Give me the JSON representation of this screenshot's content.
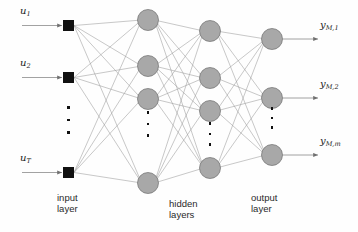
{
  "diagram": {
    "background_color": "#fefefe",
    "node_fill": "#a8a8a8",
    "node_stroke": "#6e6e6e",
    "input_node_fill": "#111111",
    "edge_color": "#9a9a9a",
    "arrow_color": "#6f6f6f"
  },
  "inputs": {
    "labels": [
      "u",
      "u",
      "u"
    ],
    "subscripts": [
      "1",
      "2",
      "T"
    ],
    "nodes": [
      {
        "x": 68.5,
        "y": 25.5
      },
      {
        "x": 68.5,
        "y": 77.5
      },
      {
        "x": 68.5,
        "y": 172.5
      }
    ],
    "arrow_start_x": 22,
    "label_positions": [
      {
        "x": 20,
        "y": 5
      },
      {
        "x": 20,
        "y": 57
      },
      {
        "x": 20,
        "y": 152
      }
    ],
    "ellipsis": {
      "x": 68.5,
      "y": 120,
      "count": 3,
      "height": 28
    }
  },
  "hidden": {
    "columns": [
      {
        "cx": 148,
        "nodes_y": [
          20,
          66,
          99,
          183
        ],
        "ellipsis": {
          "y": 124,
          "height": 26
        }
      },
      {
        "cx": 210,
        "nodes_y": [
          31,
          78,
          111,
          168
        ],
        "ellipsis": {
          "y": 134,
          "height": 24
        }
      }
    ],
    "radius": 10.5
  },
  "output": {
    "cx": 272,
    "nodes_y": [
      39,
      98,
      155
    ],
    "radius": 10.5,
    "labels": [
      "y",
      "y",
      "y"
    ],
    "subscripts": [
      "M,1",
      "M,2",
      "M,m"
    ],
    "arrow_end_x": 318,
    "label_positions": [
      {
        "x": 320,
        "y": 19
      },
      {
        "x": 320,
        "y": 78
      },
      {
        "x": 320,
        "y": 135
      }
    ],
    "ellipsis": {
      "x": 272,
      "y": 118,
      "height": 22
    }
  },
  "layer_labels": [
    {
      "line1": "input",
      "line2": "layer",
      "x": 57,
      "y": 193
    },
    {
      "line1": "hidden",
      "line2": "layers",
      "x": 169,
      "y": 199
    },
    {
      "line1": "output",
      "line2": "layer",
      "x": 251,
      "y": 193
    }
  ]
}
